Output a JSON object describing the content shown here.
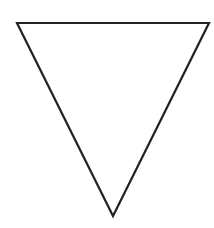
{
  "canvas": {
    "width": 214,
    "height": 228,
    "background_color": "#ffffff"
  },
  "figure": {
    "name": "inverted-triangle",
    "label": "Downward-pointing triangle outline",
    "shape_type": "triangle",
    "orientation": "point-down",
    "fill_color": "#ffffff",
    "filled": "false",
    "stroke_color": "#222222",
    "stroke_width": "2.2",
    "vertices": [
      {
        "name": "top-left",
        "x": 17,
        "y": 23
      },
      {
        "name": "top-right",
        "x": 209,
        "y": 23
      },
      {
        "name": "bottom-apex",
        "x": 113,
        "y": 216
      }
    ],
    "points_attr": "17,23 209,23 113,216",
    "base_width": 192,
    "height_px": 193
  }
}
